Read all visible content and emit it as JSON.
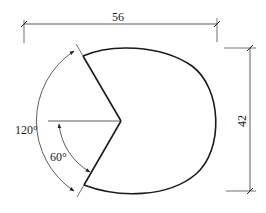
{
  "diagram": {
    "type": "technical-drawing",
    "shape": "egg-shaped ellipse with V-notch cutout",
    "colors": {
      "stroke": "#1a1a1a",
      "thin_stroke": "#333333",
      "background": "#ffffff"
    },
    "dimensions": {
      "width_label": "56",
      "height_label": "42",
      "outer_angle_label": "120°",
      "inner_angle_label": "60°"
    }
  }
}
